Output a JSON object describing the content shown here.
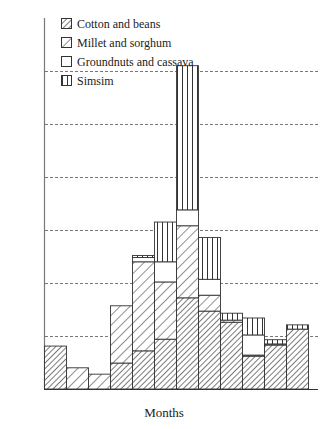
{
  "chart_data": {
    "type": "bar",
    "stacked": true,
    "title": "",
    "xlabel": "Months",
    "ylabel": "",
    "grid": true,
    "legend_position": "top-left inside",
    "categories": [
      "1",
      "2",
      "3",
      "4",
      "5",
      "6",
      "7",
      "8",
      "9",
      "10",
      "11",
      "12"
    ],
    "units_note": "heights in gridline units (1 unit = spacing between dashed gridlines); y-axis unlabeled",
    "ylim": [
      0,
      6.2
    ],
    "gridlines": [
      1,
      2,
      3,
      4,
      5,
      6
    ],
    "series": [
      {
        "name": "Cotton and beans",
        "pattern": "dense-diagonal",
        "values": [
          0.81,
          0.0,
          0.0,
          0.49,
          0.72,
          0.94,
          1.72,
          1.47,
          1.26,
          0.62,
          0.83,
          1.13
        ]
      },
      {
        "name": "Millet and sorghum",
        "pattern": "sparse-diagonal",
        "values": [
          0.0,
          0.4,
          0.28,
          1.08,
          1.68,
          1.08,
          1.36,
          0.3,
          0.04,
          0.02,
          0.0,
          0.0
        ]
      },
      {
        "name": "Groundnuts and cassava",
        "pattern": "blank",
        "values": [
          0.0,
          0.0,
          0.0,
          0.0,
          0.08,
          0.38,
          0.3,
          0.3,
          0.0,
          0.38,
          0.02,
          0.0
        ]
      },
      {
        "name": "Simsim",
        "pattern": "vertical-lines",
        "values": [
          0.0,
          0.0,
          0.0,
          0.0,
          0.04,
          0.75,
          2.72,
          0.79,
          0.13,
          0.32,
          0.08,
          0.08
        ]
      }
    ]
  },
  "legend": [
    {
      "label": "Cotton and beans",
      "pattern": "dense"
    },
    {
      "label": "Millet and sorghum",
      "pattern": "sparse"
    },
    {
      "label": "Groundnuts and cassava",
      "pattern": "blank"
    },
    {
      "label": "Simsim",
      "pattern": "vertical"
    }
  ],
  "xlabel": "Months"
}
